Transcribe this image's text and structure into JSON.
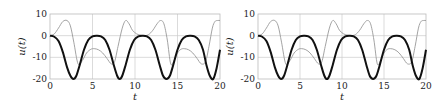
{
  "chart_data": [
    {
      "type": "line",
      "title": "",
      "xlabel": "t",
      "ylabel": "u(t)",
      "xlim": [
        0,
        20
      ],
      "ylim": [
        -20,
        10
      ],
      "xticks": [
        0,
        5,
        10,
        15,
        20
      ],
      "yticks": [
        10,
        0,
        -10,
        -20
      ],
      "grid": true,
      "legend": null,
      "series": [
        {
          "name": "thick",
          "color": "#111111",
          "width": 2,
          "x": [
            0,
            0.5,
            1.0,
            1.5,
            2.0,
            2.4,
            2.75,
            3.1,
            3.5,
            4.0,
            4.5,
            5.0,
            5.5,
            6.0,
            6.5,
            7.0,
            7.5,
            7.9,
            8.2,
            8.5,
            8.9,
            9.4,
            9.9,
            10.4,
            10.9,
            11.4,
            11.9,
            12.4,
            12.9,
            13.3,
            13.7,
            14.1,
            14.5,
            15.0,
            15.5,
            16.0,
            16.5,
            17.0,
            17.5,
            18.0,
            18.4,
            18.8,
            19.2,
            19.6,
            20.0
          ],
          "y": [
            0,
            -0.5,
            -2.5,
            -7.5,
            -14.5,
            -18.5,
            -20,
            -18.5,
            -13.5,
            -6.5,
            -2,
            -0.3,
            0,
            -0.3,
            -2,
            -6.5,
            -13.5,
            -18.5,
            -20,
            -18.5,
            -13.5,
            -6.5,
            -2,
            -0.3,
            0,
            -0.3,
            -2,
            -6.5,
            -13.5,
            -18.5,
            -20,
            -18.5,
            -13.5,
            -6.5,
            -2,
            -0.3,
            0,
            -0.3,
            -2,
            -6.5,
            -13.5,
            -18.5,
            -20,
            -15,
            -6.5
          ]
        },
        {
          "name": "thin",
          "color": "#999999",
          "width": 0.9,
          "x": [
            0,
            0.5,
            1.0,
            1.5,
            2.0,
            2.4,
            2.8,
            3.3,
            3.8,
            4.3,
            4.8,
            5.2,
            5.7,
            6.2,
            6.7,
            7.2,
            7.6,
            8.0,
            8.5,
            8.9,
            9.3,
            9.7,
            10.2,
            10.7,
            11.1,
            11.6,
            12.1,
            12.6,
            13.0,
            13.4,
            13.8,
            14.2,
            14.6,
            15.0,
            15.4,
            15.8,
            16.3,
            16.8,
            17.3,
            17.8,
            18.3,
            18.7,
            19.1,
            19.4,
            19.7,
            20.0
          ],
          "y": [
            0,
            0.8,
            3.5,
            6.5,
            7,
            4.5,
            -3,
            -13,
            -11.5,
            -8,
            -6.3,
            -6,
            -6.5,
            -8,
            -10.5,
            -13,
            -12,
            -5,
            3.5,
            7,
            5.5,
            2.5,
            0.8,
            0.2,
            0,
            0.5,
            2.5,
            5.5,
            7,
            5.5,
            -2,
            -13,
            -11.5,
            -8,
            -6.3,
            -6,
            -6.5,
            -8,
            -10.5,
            -13,
            -12,
            -5,
            3.5,
            6.5,
            7,
            7
          ]
        }
      ]
    },
    {
      "type": "line",
      "title": "",
      "xlabel": "t",
      "ylabel": "u(t)",
      "xlim": [
        0,
        20
      ],
      "ylim": [
        -20,
        10
      ],
      "xticks": [
        0,
        5,
        10,
        15,
        20
      ],
      "yticks": [
        10,
        0,
        -10,
        -20
      ],
      "grid": true,
      "legend": null,
      "series": [
        {
          "name": "thick",
          "color": "#111111",
          "width": 2,
          "x": [
            0,
            0.5,
            1.0,
            1.5,
            2.0,
            2.4,
            2.75,
            3.1,
            3.5,
            4.0,
            4.5,
            5.0,
            5.5,
            6.0,
            6.5,
            7.0,
            7.5,
            7.9,
            8.2,
            8.5,
            8.9,
            9.4,
            9.9,
            10.4,
            10.9,
            11.4,
            11.9,
            12.4,
            12.9,
            13.3,
            13.7,
            14.1,
            14.5,
            15.0,
            15.5,
            16.0,
            16.5,
            17.0,
            17.5,
            18.0,
            18.4,
            18.8,
            19.2,
            19.6,
            20.0
          ],
          "y": [
            0,
            -0.5,
            -2.5,
            -7.5,
            -14.5,
            -18.5,
            -20,
            -18.5,
            -13.5,
            -6.5,
            -2,
            -0.3,
            0,
            -0.3,
            -2,
            -6.5,
            -13.5,
            -18.5,
            -20,
            -18.5,
            -13.5,
            -6.5,
            -2,
            -0.3,
            0,
            -0.3,
            -2,
            -6.5,
            -13.5,
            -18.5,
            -20,
            -18.5,
            -13.5,
            -6.5,
            -2,
            -0.3,
            0,
            -0.3,
            -2,
            -6.5,
            -13.5,
            -18.5,
            -20,
            -15,
            -6.5
          ]
        },
        {
          "name": "thin",
          "color": "#999999",
          "width": 0.9,
          "x": [
            0,
            0.5,
            1.0,
            1.5,
            2.0,
            2.4,
            2.8,
            3.3,
            3.8,
            4.3,
            4.8,
            5.2,
            5.7,
            6.2,
            6.7,
            7.2,
            7.6,
            8.0,
            8.5,
            8.9,
            9.3,
            9.7,
            10.2,
            10.7,
            11.1,
            11.6,
            12.1,
            12.6,
            13.0,
            13.4,
            13.8,
            14.2,
            14.6,
            15.0,
            15.4,
            15.8,
            16.3,
            16.8,
            17.3,
            17.8,
            18.3,
            18.7,
            19.1,
            19.4,
            19.7,
            20.0
          ],
          "y": [
            0,
            0.8,
            3.5,
            6.5,
            7,
            4.5,
            -3,
            -13,
            -11.5,
            -8,
            -6.3,
            -6,
            -6.5,
            -8,
            -10.5,
            -13,
            -12,
            -5,
            3.5,
            7,
            5.5,
            2.5,
            0.8,
            0.2,
            0,
            0.5,
            2.5,
            5.5,
            7,
            5.5,
            -2,
            -13,
            -11.5,
            -8,
            -6.3,
            -6,
            -6.5,
            -8,
            -10.5,
            -13,
            -12,
            -5,
            3.5,
            6.5,
            7,
            7
          ]
        }
      ]
    }
  ],
  "layout": {
    "panels": [
      {
        "x0": 50,
        "x1": 220,
        "y0": 14,
        "y1": 79
      },
      {
        "x0": 258,
        "x1": 426,
        "y0": 14,
        "y1": 79
      }
    ],
    "grid_color": "#cccccc",
    "frame_color": "#bbbbbb"
  }
}
